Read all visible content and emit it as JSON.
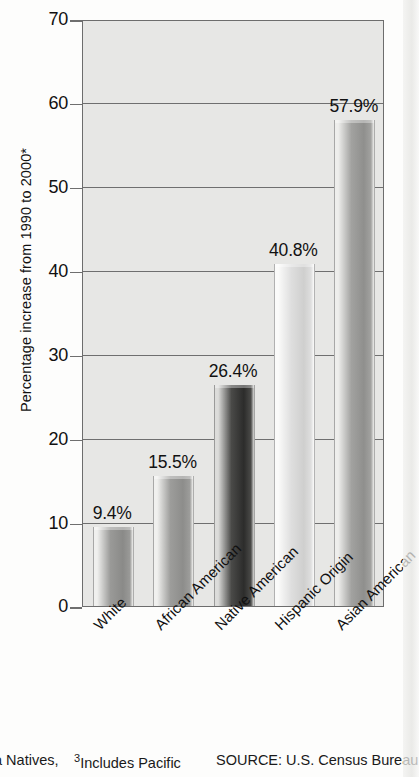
{
  "chart_data": {
    "type": "bar",
    "title": "",
    "xlabel": "",
    "ylabel": "Percentage increase from 1990 to 2000*",
    "ylim": [
      0,
      70
    ],
    "yticks": [
      0,
      10,
      20,
      30,
      40,
      50,
      60,
      70
    ],
    "grid": true,
    "legend": "none",
    "categories": [
      "White",
      "African American",
      "Native American",
      "Hispanic Origin",
      "Asian American"
    ],
    "values": [
      9.4,
      15.5,
      26.4,
      40.8,
      57.9
    ],
    "value_labels": [
      "9.4%",
      "15.5%",
      "26.4%",
      "40.8%",
      "57.9%"
    ],
    "bar_styles": [
      {
        "name": "White",
        "shade": "medium-gray",
        "light": "#f0f0ee",
        "mid": "#9a9a98",
        "dark": "#8a8a88"
      },
      {
        "name": "African American",
        "shade": "medium-gray",
        "light": "#f0f0ee",
        "mid": "#9d9d9b",
        "dark": "#8d8d8b"
      },
      {
        "name": "Native American",
        "shade": "dark-gray",
        "light": "#dcdcda",
        "mid": "#4a4a48",
        "dark": "#2c2c2b"
      },
      {
        "name": "Hispanic Origin",
        "shade": "light-gray",
        "light": "#fbfbfa",
        "mid": "#dedede",
        "dark": "#cfcfce"
      },
      {
        "name": "Asian American",
        "shade": "medium-gray",
        "light": "#eeeeec",
        "mid": "#a2a2a0",
        "dark": "#8f8f8d"
      }
    ],
    "plot_background": "#e7e7e5",
    "axis_color": "#6f6f6f"
  },
  "axis": {
    "y_label": "Percentage increase from 1990 to 2000*",
    "tick_70": "70",
    "tick_60": "60",
    "tick_50": "50",
    "tick_40": "40",
    "tick_30": "30",
    "tick_20": "20",
    "tick_10": "10",
    "tick_0": "0"
  },
  "categories": [
    {
      "label": "White",
      "value_label": "9.4%"
    },
    {
      "label": "African American",
      "value_label": "15.5%"
    },
    {
      "label": "Native American",
      "value_label": "26.4%"
    },
    {
      "label": "Hispanic Origin",
      "value_label": "40.8%"
    },
    {
      "label": "Asian American",
      "value_label": "57.9%"
    }
  ],
  "footnotes": {
    "left_fragment": "a Natives,",
    "middle_marker": "3",
    "middle_text": "Includes Pacific",
    "source": "SOURCE: U.S. Census Bureau"
  }
}
